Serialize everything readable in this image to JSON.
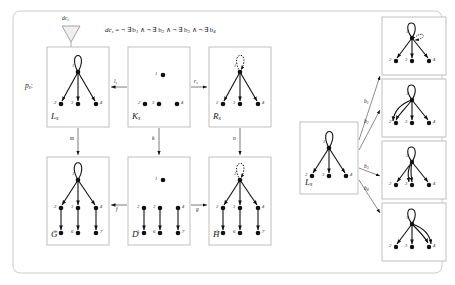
{
  "figure": {
    "type": "graph-transformation-diagram",
    "outer_border": true,
    "accent_color": "#111111",
    "box_border_color": "#b8b8b8",
    "background": "#ffffff"
  },
  "formula": {
    "lhs": "dc",
    "lhs_sub": "s",
    "eq": "=",
    "terms": [
      "¬ ∃ b",
      "¬ ∃ b",
      "¬ ∃ b",
      "¬ ∃ b"
    ],
    "term_subs": [
      "1",
      "2",
      "3",
      "4"
    ],
    "conj": "∧",
    "full_text": "dcₛ = ¬ ∃ b₁ ∧ ¬ ∃ b₂ ∧ ¬ ∃ b₃ ∧ ¬ ∃ b₄"
  },
  "labels": {
    "dc_marker": "dc",
    "dc_marker_sub": "s",
    "rule_name": "p",
    "rule_name_sub": "s",
    "rule_colon": ":"
  },
  "boxes": [
    {
      "id": "Ls",
      "label": "L",
      "label_sub": "s",
      "x": 47,
      "y": 47,
      "w": 62,
      "h": 80,
      "nodes": [
        "1",
        "2",
        "3",
        "4"
      ],
      "loop": "solid",
      "extra": "none"
    },
    {
      "id": "Ks",
      "label": "K",
      "label_sub": "s",
      "x": 128,
      "y": 47,
      "w": 62,
      "h": 80,
      "nodes": [
        "1",
        "2",
        "3",
        "4"
      ],
      "loop": "none",
      "extra": "no-edges"
    },
    {
      "id": "Rs",
      "label": "R",
      "label_sub": "s",
      "x": 209,
      "y": 47,
      "w": 62,
      "h": 80,
      "nodes": [
        "1",
        "2",
        "3",
        "4"
      ],
      "loop": "dotted",
      "extra": "none"
    },
    {
      "id": "G",
      "label": "G",
      "label_sub": "",
      "x": 47,
      "y": 157,
      "w": 62,
      "h": 88,
      "nodes": [
        "1",
        "2",
        "3",
        "4",
        "5",
        "6",
        "7"
      ],
      "loop": "solid",
      "extra": "lower"
    },
    {
      "id": "D",
      "label": "D",
      "label_sub": "",
      "x": 128,
      "y": 157,
      "w": 62,
      "h": 88,
      "nodes": [
        "1",
        "2",
        "3",
        "4",
        "5",
        "6",
        "7"
      ],
      "loop": "none",
      "extra": "lower-only"
    },
    {
      "id": "H",
      "label": "H",
      "label_sub": "",
      "x": 209,
      "y": 157,
      "w": 62,
      "h": 88,
      "nodes": [
        "1",
        "2",
        "3",
        "4",
        "5",
        "6",
        "7"
      ],
      "loop": "dotted",
      "extra": "lower"
    },
    {
      "id": "Ls2",
      "label": "L",
      "label_sub": "s",
      "x": 300,
      "y": 122,
      "w": 58,
      "h": 72,
      "nodes": [
        "1",
        "2",
        "3",
        "4"
      ],
      "loop": "solid",
      "extra": "none"
    }
  ],
  "condition_boxes": [
    {
      "id": "b1",
      "x": 382,
      "y": 17,
      "w": 64,
      "h": 58,
      "nodes": [
        "1",
        "2",
        "3",
        "4"
      ],
      "loop": "solid",
      "dotted_loop": true,
      "double_edge_to": null
    },
    {
      "id": "b2",
      "x": 382,
      "y": 79,
      "w": 64,
      "h": 58,
      "nodes": [
        "1",
        "2",
        "3",
        "4"
      ],
      "loop": "solid",
      "dotted_loop": false,
      "double_edge_to": "2"
    },
    {
      "id": "b3",
      "x": 382,
      "y": 141,
      "w": 64,
      "h": 58,
      "nodes": [
        "1",
        "2",
        "3",
        "4"
      ],
      "loop": "solid",
      "dotted_loop": false,
      "double_edge_to": "3"
    },
    {
      "id": "b4",
      "x": 382,
      "y": 203,
      "w": 64,
      "h": 58,
      "nodes": [
        "1",
        "2",
        "3",
        "4"
      ],
      "loop": "solid",
      "dotted_loop": false,
      "double_edge_to": "4"
    }
  ],
  "arrows": [
    {
      "id": "l_s",
      "label": "l",
      "label_sub": "s",
      "from": "Ks",
      "to": "Ls",
      "dir": "left"
    },
    {
      "id": "r_s",
      "label": "r",
      "label_sub": "s",
      "from": "Ks",
      "to": "Rs",
      "dir": "right"
    },
    {
      "id": "m",
      "label": "m",
      "label_sub": "",
      "from": "Ls",
      "to": "G",
      "dir": "down"
    },
    {
      "id": "k",
      "label": "k",
      "label_sub": "",
      "from": "Ks",
      "to": "D",
      "dir": "down"
    },
    {
      "id": "n",
      "label": "n",
      "label_sub": "",
      "from": "Rs",
      "to": "H",
      "dir": "down"
    },
    {
      "id": "f",
      "label": "f",
      "label_sub": "",
      "from": "D",
      "to": "G",
      "dir": "left"
    },
    {
      "id": "g",
      "label": "g",
      "label_sub": "",
      "from": "D",
      "to": "H",
      "dir": "right"
    }
  ],
  "branch_arrows": [
    {
      "id": "b1",
      "label": "b",
      "label_sub": "1"
    },
    {
      "id": "b2",
      "label": "b",
      "label_sub": "2"
    },
    {
      "id": "b3",
      "label": "b",
      "label_sub": "3"
    },
    {
      "id": "b4",
      "label": "b",
      "label_sub": "4"
    }
  ]
}
